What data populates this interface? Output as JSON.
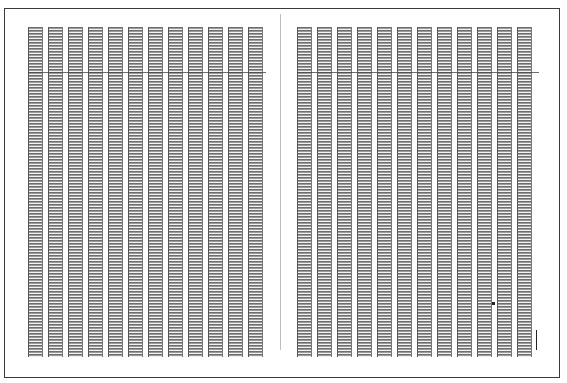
{
  "document": {
    "type": "scanned ledger spread",
    "pages": [
      {
        "side": "left",
        "column_count": 12,
        "columns_x": [
          28,
          48,
          68,
          88,
          108,
          128,
          148,
          168,
          188,
          208,
          228,
          248
        ],
        "column_width": 15,
        "top": 27,
        "bottom": 357,
        "header_rule_y": 72,
        "text_legible": false
      },
      {
        "side": "right",
        "column_count": 12,
        "columns_x": [
          297,
          317,
          337,
          357,
          377,
          397,
          417,
          437,
          457,
          477,
          497,
          517
        ],
        "column_width": 15,
        "top": 27,
        "bottom": 357,
        "header_rule_y": 72,
        "text_legible": false
      }
    ],
    "frame": {
      "left": 4,
      "top": 8,
      "right": 561,
      "bottom": 378
    },
    "gutter_x": 280,
    "colors": {
      "border": "#3a3a3a",
      "row_dark": "#6e6e6e",
      "row_mid": "#9a9a9a",
      "row_gap": "#f2f2f2",
      "gutter": "#bdbdbd"
    },
    "label": "Two facing pages of a dense 12-column tabular register (illegible at this resolution)"
  }
}
